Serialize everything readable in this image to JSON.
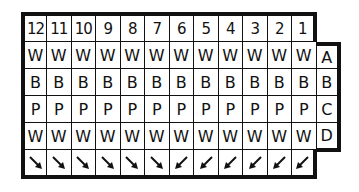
{
  "diagram": {
    "type": "connector-pinout-grid",
    "header_row": [
      "12",
      "11",
      "10",
      "9",
      "8",
      "7",
      "6",
      "5",
      "4",
      "3",
      "2",
      "1"
    ],
    "rows": [
      {
        "label": "A",
        "cells": [
          "W",
          "W",
          "W",
          "W",
          "W",
          "W",
          "W",
          "W",
          "W",
          "W",
          "W",
          "W"
        ]
      },
      {
        "label": "B",
        "cells": [
          "B",
          "B",
          "B",
          "B",
          "B",
          "B",
          "B",
          "B",
          "B",
          "B",
          "B",
          "B"
        ]
      },
      {
        "label": "C",
        "cells": [
          "P",
          "P",
          "P",
          "P",
          "P",
          "P",
          "P",
          "P",
          "P",
          "P",
          "P",
          "P"
        ]
      },
      {
        "label": "D",
        "cells": [
          "W",
          "W",
          "W",
          "W",
          "W",
          "W",
          "W",
          "W",
          "W",
          "W",
          "W",
          "W"
        ]
      }
    ],
    "arrow_row": [
      "down-right",
      "down-right",
      "down-right",
      "down-right",
      "down-right",
      "down-right",
      "down-left",
      "down-left",
      "down-left",
      "down-left",
      "down-left",
      "down-left"
    ],
    "colors": {
      "line": "#111111",
      "background": "#ffffff"
    }
  }
}
